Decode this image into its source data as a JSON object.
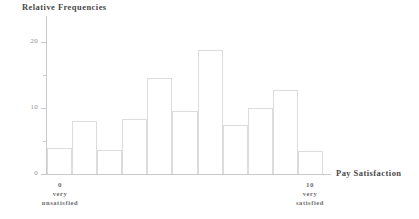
{
  "chart_data": {
    "type": "bar",
    "title": "Relative Frequencies",
    "xlabel": "Pay Satisfaction",
    "ylabel": "Relative Frequencies",
    "categories": [
      "0",
      "1",
      "2",
      "3",
      "4",
      "5",
      "6",
      "7",
      "8",
      "9",
      "10"
    ],
    "values": [
      4.0,
      8.1,
      3.6,
      8.3,
      14.6,
      9.6,
      18.8,
      7.5,
      10.1,
      12.8,
      3.5
    ],
    "ylim": [
      0,
      24
    ],
    "xlim": [
      0,
      11
    ],
    "y_ticks_major": [
      "0",
      "10",
      "20"
    ],
    "y_ticks_major_values": [
      0,
      10,
      20
    ],
    "y_ticks_minor_values": [
      5,
      15
    ],
    "grid": false,
    "legend": false,
    "bar_fill_color": "#ffffff",
    "bar_edge_color": "#dcdcdc",
    "axis_color": "#c9c9c9",
    "text_color": "#4a4a4a"
  },
  "labels": {
    "y_axis_title": "Relative Frequencies",
    "x_axis_title": "Pay Satisfaction",
    "x_left_value": "0",
    "x_left_desc_line1": "very",
    "x_left_desc_line2": "unsatisfied",
    "x_right_value": "10",
    "x_right_desc_line1": "very",
    "x_right_desc_line2": "satisfied"
  }
}
